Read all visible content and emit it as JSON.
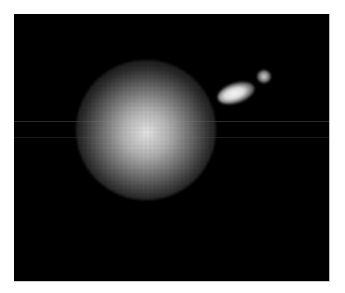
{
  "image": {
    "description": "Grayscale image of a diffuse bright globular cloud with a smaller elongated bright blob and faint knot to its upper right, on black background",
    "background_color": "#000000",
    "page_background": "#ffffff",
    "features": [
      {
        "name": "main-cloud",
        "shape": "circle",
        "center": [
          146,
          130
        ],
        "radius": 70,
        "color": "#e8e8e8"
      },
      {
        "name": "elongated-blob",
        "shape": "ellipse",
        "center": [
          236,
          93
        ],
        "size": [
          38,
          20
        ],
        "color": "#f8f8f8"
      },
      {
        "name": "small-knot",
        "shape": "circle",
        "center": [
          264,
          76
        ],
        "radius": 7,
        "color": "#d8d8d8"
      }
    ]
  }
}
